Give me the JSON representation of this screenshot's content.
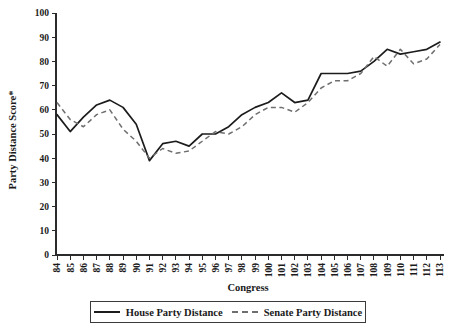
{
  "chart_data": {
    "type": "line",
    "title": "",
    "xlabel": "Congress",
    "ylabel": "Party Distance Score*",
    "xlim": [
      84,
      113
    ],
    "ylim": [
      0,
      100
    ],
    "grid": false,
    "legend_position": "bottom",
    "categories": [
      84,
      85,
      86,
      87,
      88,
      89,
      90,
      91,
      92,
      93,
      94,
      95,
      96,
      97,
      98,
      99,
      100,
      101,
      102,
      103,
      104,
      105,
      106,
      107,
      108,
      109,
      110,
      111,
      112,
      113
    ],
    "x_tick_labels": [
      "84",
      "85",
      "86",
      "87",
      "88",
      "89",
      "90",
      "91",
      "92",
      "93",
      "94",
      "95",
      "96",
      "97",
      "98",
      "99",
      "100",
      "101",
      "102",
      "103",
      "104",
      "105",
      "106",
      "107",
      "108",
      "109",
      "110",
      "111",
      "112",
      "113"
    ],
    "y_tick_labels": [
      "0",
      "10",
      "20",
      "30",
      "40",
      "50",
      "60",
      "70",
      "80",
      "90",
      "100"
    ],
    "y_ticks": [
      0,
      10,
      20,
      30,
      40,
      50,
      60,
      70,
      80,
      90,
      100
    ],
    "series": [
      {
        "name": "House Party Distance",
        "style": "solid",
        "color": "#1c1c1c",
        "values": [
          58,
          51,
          57,
          62,
          64,
          61,
          54,
          39,
          46,
          47,
          45,
          50,
          50,
          53,
          58,
          61,
          63,
          67,
          63,
          64,
          75,
          75,
          75,
          76,
          80,
          85,
          83,
          84,
          85,
          88
        ]
      },
      {
        "name": "Senate Party Distance",
        "style": "dashed",
        "color": "#6f6f6f",
        "values": [
          63,
          56,
          53,
          58,
          60,
          52,
          47,
          40,
          44,
          42,
          43,
          47,
          51,
          50,
          53,
          58,
          61,
          61,
          59,
          63,
          69,
          72,
          72,
          75,
          82,
          78,
          85,
          79,
          81,
          87
        ]
      }
    ]
  },
  "legend": {
    "entries": [
      {
        "label": "House Party Distance",
        "style": "solid"
      },
      {
        "label": "Senate Party Distance",
        "style": "dashed"
      }
    ]
  }
}
